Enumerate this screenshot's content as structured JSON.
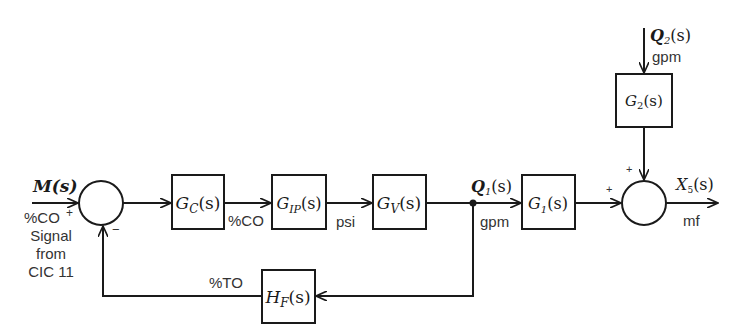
{
  "diagram": {
    "type": "block-diagram",
    "input": {
      "name": "M(s)",
      "unit": "%CO",
      "note_lines": [
        "Signal",
        "from",
        "CIC 11"
      ]
    },
    "summing_junction_1": {
      "signs": {
        "left": "+",
        "bottom": "−"
      }
    },
    "blocks": {
      "controller": {
        "base": "G",
        "sub": "C",
        "arg": "(s)"
      },
      "transducer": {
        "base": "G",
        "sub": "IP",
        "arg": "(s)"
      },
      "valve": {
        "base": "G",
        "sub": "V",
        "arg": "(s)"
      },
      "process_1": {
        "base": "G",
        "sub": "1",
        "arg": "(s)"
      },
      "process_2": {
        "base": "G",
        "sub": "2",
        "arg": "(s)"
      },
      "feedback": {
        "base": "H",
        "sub": "F",
        "arg": "(s)"
      }
    },
    "signal_units": {
      "controller_out": "%CO",
      "transducer_out": "psi",
      "valve_out": "gpm",
      "feedback_out": "%TO",
      "output": "mf",
      "disturbance": "gpm"
    },
    "signals": {
      "flow_1": {
        "base": "Q",
        "sub": "1",
        "arg": "(s)"
      },
      "flow_2": {
        "base": "Q",
        "sub": "2",
        "arg": "(s)"
      },
      "output": {
        "base": "X",
        "sub": "5",
        "arg": "(s)"
      }
    },
    "summing_junction_2": {
      "signs": {
        "left": "+",
        "top": "+"
      }
    }
  }
}
